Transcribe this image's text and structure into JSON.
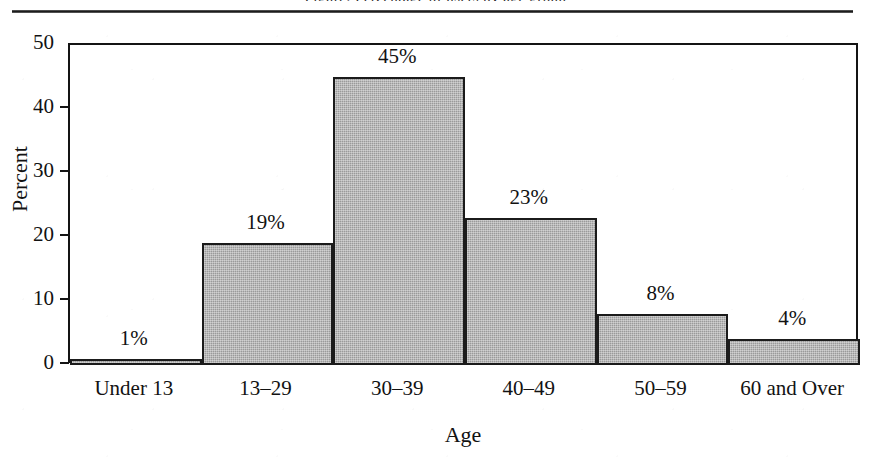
{
  "page": {
    "cropped_caption": "Figure: Percentage of users by age group",
    "top_rule": "horizontal-rule"
  },
  "chart_data": {
    "type": "bar",
    "title": "",
    "xlabel": "Age",
    "ylabel": "Percent",
    "categories": [
      "Under 13",
      "13–29",
      "30–39",
      "40–49",
      "50–59",
      "60 and Over"
    ],
    "values": [
      1,
      19,
      45,
      23,
      8,
      4
    ],
    "data_labels": [
      "1%",
      "19%",
      "45%",
      "23%",
      "8%",
      "4%"
    ],
    "ylim": [
      0,
      50
    ],
    "yticks": [
      0,
      10,
      20,
      30,
      40,
      50
    ],
    "ytick_labels": [
      "0",
      "10",
      "20",
      "30",
      "40",
      "50"
    ],
    "grid": false,
    "legend": "none",
    "bar_fill_color": "#9a9a9a",
    "bar_border_color": "#1b1b1b",
    "axis_color": "#141414",
    "text_color": "#121212",
    "bars_touch": true
  }
}
